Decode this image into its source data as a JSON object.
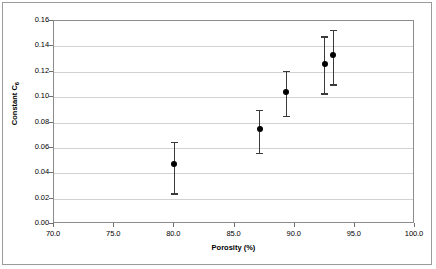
{
  "chart_data": {
    "type": "scatter",
    "title": "",
    "xlabel": "Porosity (%)",
    "ylabel": "Constant C6",
    "ylabel_base": "Constant C",
    "ylabel_sub": "6",
    "xlim": [
      70.0,
      100.0
    ],
    "ylim": [
      0.0,
      0.16
    ],
    "xticks": [
      70.0,
      75.0,
      80.0,
      85.0,
      90.0,
      95.0,
      100.0
    ],
    "xtick_labels": [
      "70.0",
      "75.0",
      "80.0",
      "85.0",
      "90.0",
      "95.0",
      "100.0"
    ],
    "yticks": [
      0.0,
      0.02,
      0.04,
      0.06,
      0.08,
      0.1,
      0.12,
      0.14,
      0.16
    ],
    "ytick_labels": [
      "0.00",
      "0.02",
      "0.04",
      "0.06",
      "0.08",
      "0.10",
      "0.12",
      "0.14",
      "0.16"
    ],
    "grid": "horizontal",
    "legend": "none",
    "marker": "filled-circle",
    "errorbars": true,
    "series": [
      {
        "name": "Constant C6 vs Porosity",
        "color": "#000000",
        "errorbar_color": "#3a3a3a",
        "points": [
          {
            "x": 80.0,
            "y": 0.047,
            "y_low": 0.023,
            "y_high": 0.065
          },
          {
            "x": 87.1,
            "y": 0.075,
            "y_low": 0.055,
            "y_high": 0.09
          },
          {
            "x": 89.3,
            "y": 0.104,
            "y_low": 0.084,
            "y_high": 0.121
          },
          {
            "x": 92.5,
            "y": 0.126,
            "y_low": 0.102,
            "y_high": 0.148
          },
          {
            "x": 93.2,
            "y": 0.133,
            "y_low": 0.109,
            "y_high": 0.153
          }
        ]
      }
    ]
  }
}
